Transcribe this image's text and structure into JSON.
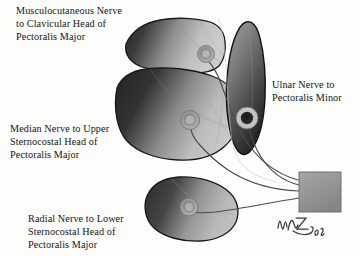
{
  "figure": {
    "background_color": "#fdfdfc",
    "width": 359,
    "height": 256
  },
  "labels": [
    {
      "id": "musculocutaneous",
      "text": "Musculocutaneous Nerve\nto Clavicular Head of\nPectoralis Major",
      "lines": [
        "Musculocutaneous Nerve",
        "to Clavicular Head of",
        "Pectoralis Major"
      ],
      "color": "#141414"
    },
    {
      "id": "median",
      "text": "Median Nerve to Upper\nSternocostal Head of\nPectoralis Major",
      "lines": [
        "Median Nerve to Upper",
        "Sternocostal Head of",
        "Pectoralis Major"
      ],
      "color": "#141414"
    },
    {
      "id": "radial",
      "text": "Radial Nerve to Lower\nSternocostal Head of\nPectoralis Major",
      "lines": [
        "Radial Nerve to Lower",
        "Sternocostal Head of",
        "Pectoralis Major"
      ],
      "color": "#141414"
    },
    {
      "id": "ulnar",
      "text": "Ulnar Nerve to\nPectoralis Minor",
      "lines": [
        "Ulnar Nerve to",
        "Pectoralis Minor"
      ],
      "color": "#141414"
    }
  ],
  "structures": {
    "clavicular_head": {
      "name": "Clavicular head of pectoralis major",
      "fill_dark": "#2c2c2c",
      "fill_light": "#c9c9c7",
      "outline": "#1b1b1b"
    },
    "upper_sternocostal_head": {
      "name": "Upper sternocostal head of pectoralis major",
      "fill_dark": "#2a2a2a",
      "fill_light": "#c4c4c2",
      "outline": "#1b1b1b"
    },
    "lower_sternocostal_head": {
      "name": "Lower sternocostal head of pectoralis major",
      "fill_dark": "#3a3a3a",
      "fill_light": "#bcbcba",
      "outline": "#1b1b1b"
    },
    "pectoralis_minor": {
      "name": "Pectoralis minor",
      "fill_dark": "#1e1e1e",
      "fill_light": "#8d8d8b",
      "outline": "#121212"
    },
    "nerve_source_block": {
      "name": "Nerve source block",
      "fill_top": "#9d9d9b",
      "fill_bottom": "#8a8a88",
      "outline": "#6f6f6d"
    },
    "nerve_lines": {
      "name": "Nerve branches",
      "color": "#4a4a4a",
      "count": 4
    },
    "motor_points": {
      "name": "Motor entry points",
      "ring_color": "#a8a8a6",
      "center_color": "#6d6d6b"
    }
  },
  "signature": {
    "initials": "DMZ",
    "year": "18",
    "color": "#3a3a3a"
  }
}
